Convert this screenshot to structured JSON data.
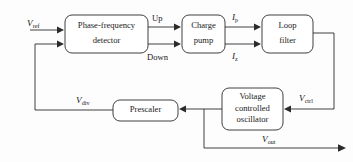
{
  "diagram": {
    "type": "block-diagram",
    "canvas": {
      "width": 353,
      "height": 162
    },
    "background_color": "#fdfdfd",
    "line_color": "#2b2b2b",
    "box_fill": "#ffffff"
  },
  "blocks": [
    {
      "id": "pfd",
      "name": "phase-frequency-detector",
      "line1": "Phase-frequency",
      "line2": "detector",
      "x": 65,
      "y": 15,
      "w": 83,
      "h": 38,
      "rx": 7
    },
    {
      "id": "cp",
      "name": "charge-pump",
      "line1": "Charge",
      "line2": "pump",
      "x": 182,
      "y": 15,
      "w": 43,
      "h": 38,
      "rx": 7
    },
    {
      "id": "lf",
      "name": "loop-filter",
      "line1": "Loop",
      "line2": "filter",
      "x": 262,
      "y": 15,
      "w": 51,
      "h": 38,
      "rx": 7
    },
    {
      "id": "vco",
      "name": "voltage-controlled-oscillator",
      "line1": "Voltage",
      "line2": "controlled",
      "line3": "oscillator",
      "x": 222,
      "y": 88,
      "w": 61,
      "h": 42,
      "rx": 7
    },
    {
      "id": "presc",
      "name": "prescaler",
      "line1": "Prescaler",
      "x": 113,
      "y": 100,
      "w": 65,
      "h": 21,
      "rx": 7
    }
  ],
  "signals": [
    {
      "id": "vref",
      "name": "v-ref-label",
      "var": "V",
      "sub": "ref",
      "x": 27,
      "y": 19
    },
    {
      "id": "up",
      "name": "up-label",
      "var": "",
      "sub": "",
      "plain": "Up",
      "x": 152,
      "y": 18
    },
    {
      "id": "down",
      "name": "down-label",
      "var": "",
      "sub": "",
      "plain": "Down",
      "x": 148,
      "y": 55
    },
    {
      "id": "ip",
      "name": "i-p-label",
      "var": "I",
      "sub": "p",
      "x": 233,
      "y": 17
    },
    {
      "id": "iz",
      "name": "i-z-label",
      "var": "I",
      "sub": "z",
      "x": 233,
      "y": 55
    },
    {
      "id": "vctrl",
      "name": "v-ctrl-label",
      "var": "V",
      "sub": "ctrl",
      "x": 299,
      "y": 95
    },
    {
      "id": "vdiv",
      "name": "v-div-label",
      "var": "V",
      "sub": "div",
      "x": 76,
      "y": 96
    },
    {
      "id": "vout",
      "name": "v-out-label",
      "var": "V",
      "sub": "out",
      "x": 262,
      "y": 130
    }
  ],
  "connections": [
    {
      "id": "vref-to-pfd",
      "name": "wire-vref-to-pfd",
      "path": "M 30 30 L 60 30",
      "arrow": "right",
      "ax": 64,
      "ay": 30
    },
    {
      "id": "fb-to-pfd",
      "name": "wire-feedback-to-pfd",
      "path": "M 35 110 L 35 44 L 60 44",
      "arrow": "right",
      "ax": 64,
      "ay": 44
    },
    {
      "id": "pfd-up-cp",
      "name": "wire-pfd-up-to-charge-pump",
      "path": "M 148 27 L 177 27",
      "arrow": "right",
      "ax": 181,
      "ay": 27
    },
    {
      "id": "pfd-down-cp",
      "name": "wire-pfd-down-to-charge-pump",
      "path": "M 148 44 L 177 44",
      "arrow": "right",
      "ax": 181,
      "ay": 44
    },
    {
      "id": "cp-ip-lf",
      "name": "wire-charge-pump-ip-to-loop-filter",
      "path": "M 225 27 L 257 27",
      "arrow": "right",
      "ax": 261,
      "ay": 27
    },
    {
      "id": "cp-iz-lf",
      "name": "wire-charge-pump-iz-to-loop-filter",
      "path": "M 225 44 L 257 44",
      "arrow": "right",
      "ax": 261,
      "ay": 44
    },
    {
      "id": "lf-to-vco",
      "name": "wire-loop-filter-to-vco",
      "path": "M 313 33 L 334 33 L 334 109 L 288 109",
      "arrow": "left",
      "ax": 284,
      "ay": 109
    },
    {
      "id": "vco-to-presc",
      "name": "wire-vco-to-prescaler",
      "path": "M 222 109 L 183 109",
      "arrow": "left",
      "ax": 179,
      "ay": 109
    },
    {
      "id": "presc-to-fb",
      "name": "wire-prescaler-to-feedback",
      "path": "M 113 110 L 35 110",
      "arrow": "none",
      "ax": 0,
      "ay": 0
    },
    {
      "id": "vco-out",
      "name": "wire-vco-output",
      "path": "M 204 109 L 204 148 L 340 148",
      "arrow": "right",
      "ax": 345,
      "ay": 148
    }
  ]
}
